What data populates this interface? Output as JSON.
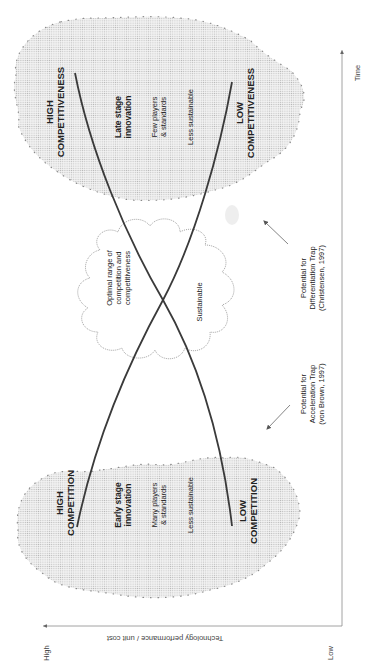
{
  "axes": {
    "y_axis_title": "Technology performance / unit cost",
    "y_high_label": "High",
    "y_low_label": "Low",
    "x_axis_title": "Time"
  },
  "early_region": {
    "top_label_line1": "HIGH",
    "top_label_line2": "COMPETITION",
    "title_line1": "Early stage",
    "title_line2": "innovation",
    "detail_line1": "Many players",
    "detail_line2": "& standards",
    "sustainability": "Less sustainable",
    "bottom_label_line1": "LOW",
    "bottom_label_line2": "COMPETITION"
  },
  "late_region": {
    "top_label_line1": "HIGH",
    "top_label_line2": "COMPETITIVENESS",
    "title_line1": "Late stage",
    "title_line2": "innovation",
    "detail_line1": "Few players",
    "detail_line2": "& standards",
    "sustainability": "Less sustainable",
    "bottom_label_line1": "LOW",
    "bottom_label_line2": "COMPETITIVENESS"
  },
  "optimal_cloud": {
    "line1": "Optimal range of",
    "line2": "competition and",
    "line3": "competitiveness",
    "sustainability": "Sustainable"
  },
  "annotations": {
    "acceleration_line1": "Potential for",
    "acceleration_line2": "Acceleration Trap",
    "acceleration_line3": "(von Brown, 1997)",
    "differentiation_line1": "Potential for",
    "differentiation_line2": "Differentiation Trap",
    "differentiation_line3": "(Christensen, 1997)"
  },
  "colors": {
    "curve": "#3a3a3a",
    "blob_fill": "#dcdcdc",
    "blob_dots": "#888888",
    "cloud_stroke": "#9a9a9a",
    "axis": "#888888"
  }
}
